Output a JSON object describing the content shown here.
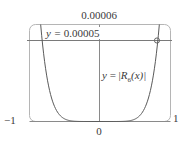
{
  "chart_data": {
    "type": "line",
    "title": "",
    "xlabel": "",
    "ylabel": "",
    "xlim": [
      -1,
      1
    ],
    "ylim": [
      0,
      6e-05
    ],
    "grid": false,
    "x_tick_labels": [
      "-1",
      "0",
      "1"
    ],
    "y_tick_labels": [
      "0.00006"
    ],
    "series": [
      {
        "name": "y = |R6(x)|",
        "x": [
          -0.84,
          -0.82,
          -0.8,
          -0.75,
          -0.7,
          -0.65,
          -0.6,
          -0.55,
          -0.5,
          -0.45,
          -0.4,
          -0.3,
          -0.2,
          0,
          0.2,
          0.3,
          0.4,
          0.45,
          0.5,
          0.55,
          0.6,
          0.65,
          0.7,
          0.75,
          0.8,
          0.82,
          0.84
        ],
        "y": [
          5.9e-05,
          5e-05,
          4.19e-05,
          2.67e-05,
          1.65e-05,
          9.8e-06,
          5.6e-06,
          3.1e-06,
          1.6e-06,
          7.5e-07,
          3.3e-07,
          4e-08,
          0.0,
          0.0,
          0.0,
          4e-08,
          3.3e-07,
          7.5e-07,
          1.6e-06,
          3.1e-06,
          5.6e-06,
          9.8e-06,
          1.65e-05,
          2.67e-05,
          4.19e-05,
          5e-05,
          5.9e-05
        ]
      },
      {
        "name": "y = 0.00005",
        "x": [
          -1,
          1
        ],
        "y": [
          5e-05,
          5e-05
        ]
      }
    ],
    "annotations": [
      {
        "text": "y = 0.00005",
        "target": "horizontal line"
      },
      {
        "text": "y = |R6(x)|",
        "target": "curve"
      },
      {
        "marker": "circle",
        "x": 0.82,
        "y": 5e-05
      }
    ],
    "colors": {
      "curve": "#555555",
      "axes": "#777777",
      "frame": "#aaaaaa"
    }
  },
  "labels": {
    "ymax": "0.00006",
    "xmin": "−1",
    "xmax": "1",
    "xzero": "0",
    "hline_prefix": "y = ",
    "hline_value": "0.00005",
    "curve_y": "y",
    "curve_eq": " = |",
    "curve_R": "R",
    "curve_sub": "6",
    "curve_arg": "(x)|"
  }
}
